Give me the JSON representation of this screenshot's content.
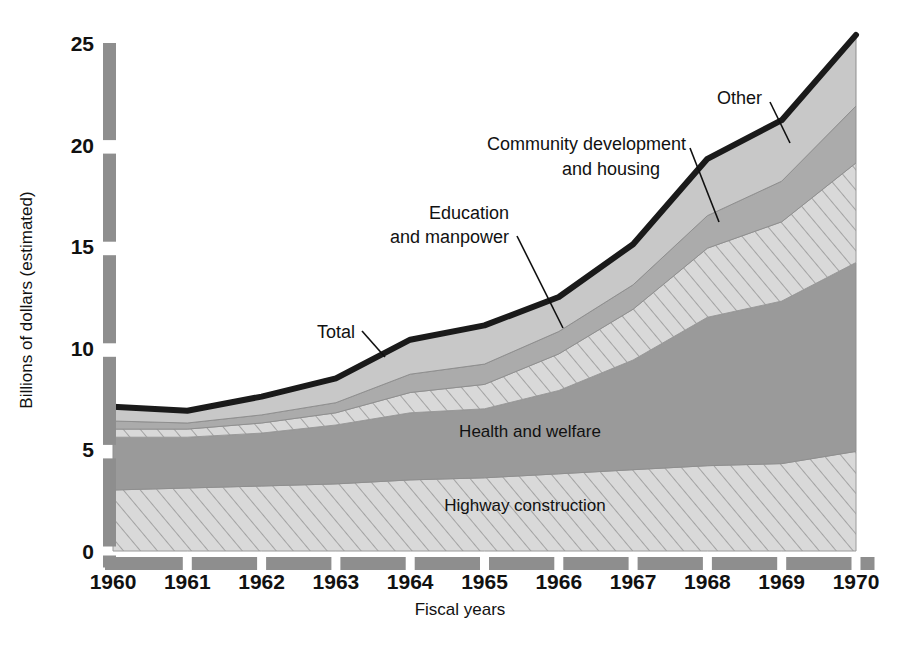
{
  "chart_data": {
    "type": "area",
    "title": "",
    "xlabel": "Fiscal years",
    "ylabel": "Billions of dollars (estimated)",
    "categories": [
      "1960",
      "1961",
      "1962",
      "1963",
      "1964",
      "1965",
      "1966",
      "1967",
      "1968",
      "1969",
      "1970"
    ],
    "x": [
      1960,
      1961,
      1962,
      1963,
      1964,
      1965,
      1966,
      1967,
      1968,
      1969,
      1970
    ],
    "ylim": [
      0,
      25
    ],
    "yticks": [
      0,
      5,
      10,
      15,
      20,
      25
    ],
    "ytick_labels": [
      "0",
      "5",
      "10",
      "15",
      "20",
      "25"
    ],
    "grid": false,
    "legend": "inline-annotations",
    "stacked": true,
    "series": [
      {
        "name": "Highway construction",
        "fill": "hatch-light",
        "values": [
          3.0,
          3.1,
          3.2,
          3.3,
          3.5,
          3.6,
          3.8,
          4.0,
          4.2,
          4.3,
          4.9
        ]
      },
      {
        "name": "Health and welfare",
        "fill": "solid-dark",
        "values": [
          2.6,
          2.5,
          2.6,
          2.9,
          3.3,
          3.4,
          4.1,
          5.4,
          7.3,
          8.0,
          9.3
        ]
      },
      {
        "name": "Education and manpower",
        "fill": "hatch-light",
        "values": [
          0.4,
          0.4,
          0.5,
          0.6,
          1.0,
          1.2,
          1.8,
          2.5,
          3.4,
          3.9,
          4.9
        ]
      },
      {
        "name": "Community development and housing",
        "fill": "solid-medium",
        "values": [
          0.4,
          0.3,
          0.4,
          0.5,
          0.9,
          1.0,
          1.1,
          1.2,
          1.6,
          2.0,
          2.8
        ]
      },
      {
        "name": "Other",
        "fill": "solid-light",
        "values": [
          0.7,
          0.6,
          0.9,
          1.2,
          1.7,
          1.9,
          1.7,
          2.0,
          2.8,
          3.0,
          3.5
        ]
      }
    ],
    "total": {
      "name": "Total",
      "values": [
        7.1,
        6.9,
        7.6,
        8.5,
        10.4,
        11.1,
        12.5,
        15.1,
        19.3,
        21.2,
        25.4
      ]
    },
    "annotations": [
      {
        "label": "Total",
        "kind": "callout"
      },
      {
        "label": "Education\nand manpower",
        "kind": "callout"
      },
      {
        "label": "Community development\nand housing",
        "kind": "callout"
      },
      {
        "label": "Other",
        "kind": "callout"
      },
      {
        "label": "Health and welfare",
        "kind": "inline"
      },
      {
        "label": "Highway construction",
        "kind": "inline"
      }
    ],
    "colors": {
      "total_line": "#1a1a1a",
      "solid_dark": "#9a9a9a",
      "solid_medium": "#ababab",
      "solid_light": "#c8c8c8",
      "hatch_bg": "#d8d8d8",
      "hatch_stroke": "#9a9a9a",
      "axis_bar": "#8e8e8e",
      "background": "#ffffff",
      "text": "#111111"
    }
  },
  "labels": {
    "y_axis_title": "Billions of dollars (estimated)",
    "x_axis_title": "Fiscal years",
    "total": "Total",
    "other": "Other",
    "community_line1": "Community development",
    "community_line2": "and housing",
    "education_line1": "Education",
    "education_line2": "and manpower",
    "health": "Health and welfare",
    "highway": "Highway construction",
    "y_ticks": [
      "25",
      "20",
      "15",
      "10",
      "5",
      "0"
    ],
    "x_ticks": [
      "1960",
      "1961",
      "1962",
      "1963",
      "1964",
      "1965",
      "1966",
      "1967",
      "1968",
      "1969",
      "1970"
    ]
  }
}
